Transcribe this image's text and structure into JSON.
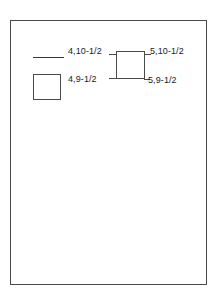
{
  "drawing": {
    "background_color": "#ffffff",
    "line_color": "#4a4a4a",
    "text_color": "#1a1a1a",
    "frame": {
      "name": "drawing-border"
    },
    "legend": {
      "line_swatch_label": "",
      "square_swatch_label": ""
    },
    "labels": {
      "top_left": "4,10-1/2",
      "top_right": "5,10-1/2",
      "bottom_left": "4,9-1/2",
      "bottom_right": "5,9-1/2"
    }
  }
}
